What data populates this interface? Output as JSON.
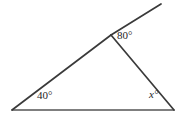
{
  "figure": {
    "background_color": "#ffffff",
    "stroke_color": "#3a3a3a",
    "base_stroke_color": "#565656",
    "text_color": "#262626",
    "width": 186,
    "height": 117,
    "labels": {
      "apex_angle": "80°",
      "left_angle": "40°",
      "right_angle": "x°"
    },
    "vertices": {
      "left": {
        "x": 12,
        "y": 110
      },
      "apex": {
        "x": 111,
        "y": 35
      },
      "right": {
        "x": 174,
        "y": 110
      },
      "ray_end": {
        "x": 161,
        "y": 4
      }
    },
    "segments": [
      {
        "name": "base",
        "from": "left",
        "to": "right"
      },
      {
        "name": "left-side",
        "from": "left",
        "to": "apex"
      },
      {
        "name": "right-side",
        "from": "apex",
        "to": "right"
      },
      {
        "name": "exterior-ray",
        "from": "apex",
        "to": "ray_end"
      }
    ]
  },
  "chart_data": {
    "type": "diagram",
    "annotations": [
      {
        "label": "80°",
        "value": 80,
        "at": "apex",
        "kind": "exterior-angle"
      },
      {
        "label": "40°",
        "value": 40,
        "at": "left-vertex",
        "kind": "interior-angle"
      },
      {
        "label": "x°",
        "value": null,
        "at": "right-vertex",
        "kind": "unknown-interior-angle"
      }
    ]
  }
}
